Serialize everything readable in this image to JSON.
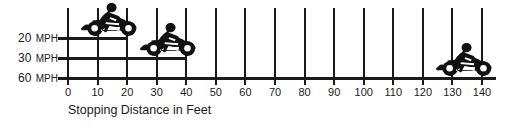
{
  "chart_data": {
    "type": "bar",
    "title": "",
    "subtitle": "",
    "xlabel": "Stopping Distance in Feet",
    "ylabel": "",
    "orientation": "horizontal",
    "categories": [
      "20 MPH",
      "30 MPH",
      "60 MPH"
    ],
    "values": [
      20,
      40,
      140
    ],
    "xlim": [
      0,
      140
    ],
    "xticks": [
      0,
      10,
      20,
      30,
      40,
      50,
      60,
      70,
      80,
      90,
      100,
      110,
      120,
      130,
      140
    ],
    "xtick_labels": [
      "0",
      "10",
      "20",
      "30",
      "40",
      "50",
      "60",
      "70",
      "80",
      "90",
      "100",
      "110",
      "120",
      "130",
      "140"
    ],
    "grid": true,
    "grid_axis": "x",
    "legend": false,
    "bar_color": "#1a1a1a",
    "grid_color": "#1a1a1a",
    "background_color": "#ffffff",
    "annotations": [
      {
        "name": "motorcycle-icon-20mph",
        "category": "20 MPH",
        "at_value": 20
      },
      {
        "name": "motorcycle-icon-30mph",
        "category": "30 MPH",
        "at_value": 40
      },
      {
        "name": "motorcycle-icon-60mph",
        "category": "60 MPH",
        "at_value": 140
      }
    ]
  },
  "axis": {
    "y_labels": [
      {
        "speed": "20",
        "unit": "MPH"
      },
      {
        "speed": "30",
        "unit": "MPH"
      },
      {
        "speed": "60",
        "unit": "MPH"
      }
    ],
    "x_title": "Stopping Distance in Feet",
    "x_ticks": [
      "0",
      "10",
      "20",
      "30",
      "40",
      "50",
      "60",
      "70",
      "80",
      "90",
      "100",
      "110",
      "120",
      "130",
      "140"
    ]
  }
}
